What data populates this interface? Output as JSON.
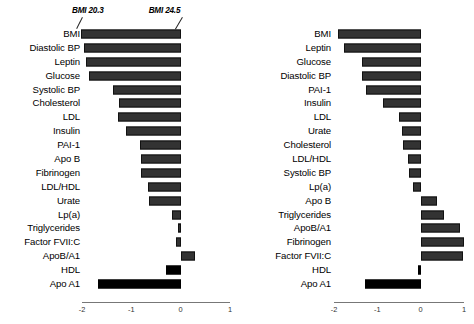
{
  "figure": {
    "title": "",
    "panels": [
      {
        "id": "left",
        "annotations": [
          {
            "name": "bmi-low-annotation",
            "text": "BMI 20.3"
          },
          {
            "name": "bmi-high-annotation",
            "text": "BMI 24.5"
          }
        ]
      },
      {
        "id": "right",
        "annotations": []
      }
    ]
  },
  "chart_data": [
    {
      "type": "bar",
      "orientation": "horizontal",
      "title": "",
      "xlabel": "",
      "ylabel": "",
      "xlim": [
        -2,
        1
      ],
      "xticks": [
        -2,
        -1,
        0,
        1
      ],
      "xticklabels": [
        "-2",
        "-1",
        "0",
        "1"
      ],
      "grid": false,
      "legend": null,
      "annotations": [
        "BMI 20.3",
        "BMI 24.5"
      ],
      "categories": [
        "BMI",
        "Diastolic BP",
        "Leptin",
        "Glucose",
        "Systolic BP",
        "Cholesterol",
        "LDL",
        "Insulin",
        "PAI-1",
        "Apo B",
        "Fibrinogen",
        "LDL/HDL",
        "Urate",
        "Lp(a)",
        "Triglycerides",
        "Factor FVII:C",
        "ApoB/A1",
        "HDL",
        "Apo A1"
      ],
      "values": [
        -2.02,
        -1.95,
        -1.92,
        -1.85,
        -1.37,
        -1.26,
        -1.28,
        -1.1,
        -0.82,
        -0.8,
        -0.8,
        -0.66,
        -0.64,
        -0.17,
        -0.06,
        -0.1,
        0.3,
        -0.3,
        -1.67
      ],
      "bar_colors": [
        "#333333",
        "#333333",
        "#333333",
        "#333333",
        "#333333",
        "#333333",
        "#333333",
        "#333333",
        "#333333",
        "#333333",
        "#333333",
        "#333333",
        "#333333",
        "#333333",
        "#333333",
        "#333333",
        "#333333",
        "#000000",
        "#000000"
      ]
    },
    {
      "type": "bar",
      "orientation": "horizontal",
      "title": "",
      "xlabel": "",
      "ylabel": "",
      "xlim": [
        -2,
        1
      ],
      "xticks": [
        -2,
        -1,
        0,
        1
      ],
      "xticklabels": [
        "-2",
        "-1",
        "0",
        "1"
      ],
      "grid": false,
      "legend": null,
      "annotations": [],
      "categories": [
        "BMI",
        "Leptin",
        "Glucose",
        "Diastolic BP",
        "PAI-1",
        "Insulin",
        "LDL",
        "Urate",
        "Cholesterol",
        "LDL/HDL",
        "Systolic BP",
        "Lp(a)",
        "Apo B",
        "Triglycerides",
        "ApoB/A1",
        "Fibrinogen",
        "Factor FVII:C",
        "HDL",
        "Apo A1"
      ],
      "values": [
        -1.9,
        -1.78,
        -1.36,
        -1.36,
        -1.26,
        -0.88,
        -0.5,
        -0.43,
        -0.4,
        -0.29,
        -0.26,
        -0.17,
        0.37,
        0.55,
        0.9,
        1.0,
        0.98,
        -0.06,
        -1.28
      ],
      "bar_colors": [
        "#333333",
        "#333333",
        "#333333",
        "#333333",
        "#333333",
        "#333333",
        "#333333",
        "#333333",
        "#333333",
        "#333333",
        "#333333",
        "#333333",
        "#333333",
        "#333333",
        "#333333",
        "#333333",
        "#333333",
        "#000000",
        "#000000"
      ]
    }
  ]
}
